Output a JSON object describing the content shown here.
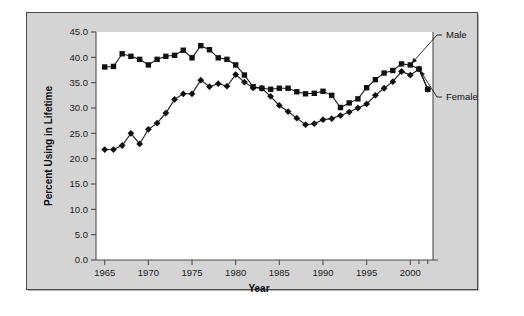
{
  "chart_data": {
    "type": "line",
    "title": "",
    "xlabel": "Year",
    "ylabel": "Percent Using in Lifetime",
    "xlim": [
      1964,
      2002.6
    ],
    "ylim": [
      0.0,
      45.0
    ],
    "grid": false,
    "legend_position": "right-annotations",
    "x_tick_labels": [
      "1965",
      "1970",
      "1975",
      "1980",
      "1985",
      "1990",
      "1995",
      "2000"
    ],
    "x_ticks": [
      1965,
      1970,
      1975,
      1980,
      1985,
      1990,
      1995,
      2000
    ],
    "y_tick_labels": [
      "0.0",
      "5.0",
      "10.0",
      "15.0",
      "20.0",
      "25.0",
      "30.0",
      "35.0",
      "40.0",
      "45.0"
    ],
    "y_ticks": [
      0.0,
      5.0,
      10.0,
      15.0,
      20.0,
      25.0,
      30.0,
      35.0,
      40.0,
      45.0
    ],
    "x": [
      1965,
      1966,
      1967,
      1968,
      1969,
      1970,
      1971,
      1972,
      1973,
      1974,
      1975,
      1976,
      1977,
      1978,
      1979,
      1980,
      1981,
      1982,
      1983,
      1984,
      1985,
      1986,
      1987,
      1988,
      1989,
      1990,
      1991,
      1992,
      1993,
      1994,
      1995,
      1996,
      1997,
      1998,
      1999,
      2000,
      2001,
      2002
    ],
    "series": [
      {
        "name": "Male",
        "marker": "square",
        "color": "#111111",
        "values": [
          38.1,
          38.2,
          40.7,
          40.2,
          39.6,
          38.5,
          39.6,
          40.2,
          40.4,
          41.4,
          39.9,
          42.3,
          41.5,
          39.9,
          39.6,
          38.5,
          36.5,
          34.2,
          33.9,
          33.7,
          33.9,
          33.9,
          33.2,
          32.8,
          32.9,
          33.3,
          32.5,
          30.1,
          31.0,
          31.8,
          34.0,
          35.6,
          36.9,
          37.4,
          38.7,
          38.5,
          37.7,
          33.7
        ]
      },
      {
        "name": "Female",
        "marker": "diamond",
        "color": "#111111",
        "values": [
          21.8,
          21.8,
          22.6,
          25.0,
          22.9,
          25.8,
          27.0,
          29.0,
          31.7,
          32.8,
          32.8,
          35.5,
          34.2,
          34.8,
          34.3,
          36.6,
          35.1,
          34.0,
          33.9,
          32.3,
          30.5,
          29.3,
          28.0,
          26.7,
          26.9,
          27.7,
          27.9,
          28.5,
          29.2,
          30.0,
          30.8,
          32.5,
          33.9,
          35.2,
          37.2,
          36.5,
          37.7,
          33.7
        ]
      }
    ],
    "annotations": [
      {
        "text": "Male",
        "target_series": "Male"
      },
      {
        "text": "Female",
        "target_series": "Female"
      }
    ]
  },
  "figure": {
    "background_color": "#d4d4d4",
    "plot_background_color": "#ffffff",
    "border_color": "#4a4a4a"
  }
}
